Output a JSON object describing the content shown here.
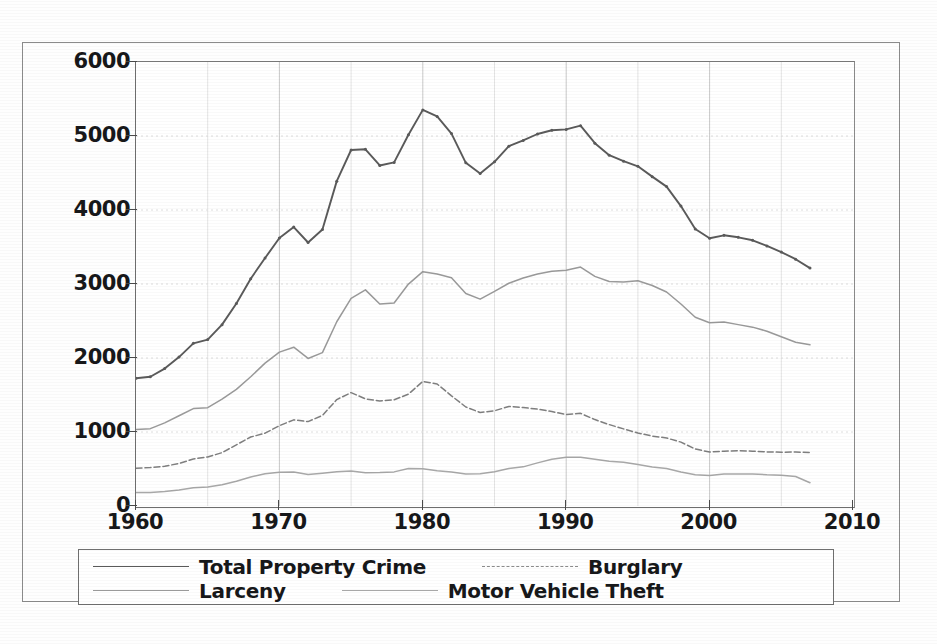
{
  "chart_data": {
    "type": "line",
    "title": "",
    "xlabel": "",
    "ylabel": "",
    "xlim": [
      1960,
      2010
    ],
    "ylim": [
      0,
      6000
    ],
    "grid": true,
    "legend_position": "below-plot",
    "x_ticks": [
      "1960",
      "1970",
      "1980",
      "1990",
      "2000",
      "2010"
    ],
    "y_ticks": [
      "0",
      "1000",
      "2000",
      "3000",
      "4000",
      "5000",
      "6000"
    ],
    "x": [
      1960,
      1961,
      1962,
      1963,
      1964,
      1965,
      1966,
      1967,
      1968,
      1969,
      1970,
      1971,
      1972,
      1973,
      1974,
      1975,
      1976,
      1977,
      1978,
      1979,
      1980,
      1981,
      1982,
      1983,
      1984,
      1985,
      1986,
      1987,
      1988,
      1989,
      1990,
      1991,
      1992,
      1993,
      1994,
      1995,
      1996,
      1997,
      1998,
      1999,
      2000,
      2001,
      2002,
      2003,
      2004,
      2005,
      2006,
      2007
    ],
    "series": [
      {
        "name": "Total Property Crime",
        "color": "#5a5a5a",
        "style": "solid",
        "values": [
          1726,
          1747,
          1857,
          2012,
          2198,
          2249,
          2451,
          2737,
          3072,
          3351,
          3621,
          3769,
          3561,
          3737,
          4390,
          4811,
          4820,
          4602,
          4643,
          5017,
          5353,
          5264,
          5033,
          4637,
          4492,
          4651,
          4863,
          4940,
          5027,
          5078,
          5089,
          5140,
          4903,
          4740,
          4660,
          4591,
          4451,
          4316,
          4053,
          3744,
          3618,
          3658,
          3631,
          3591,
          3514,
          3432,
          3335,
          3215
        ]
      },
      {
        "name": "Burglary",
        "color": "#7f7f7f",
        "style": "dashed",
        "values": [
          509,
          519,
          536,
          576,
          635,
          663,
          721,
          827,
          932,
          984,
          1085,
          1164,
          1141,
          1223,
          1438,
          1532,
          1448,
          1420,
          1435,
          1512,
          1684,
          1649,
          1489,
          1338,
          1264,
          1287,
          1345,
          1330,
          1309,
          1276,
          1236,
          1252,
          1168,
          1100,
          1042,
          987,
          945,
          919,
          863,
          770,
          729,
          741,
          747,
          741,
          730,
          727,
          729,
          722
        ]
      },
      {
        "name": "Larceny",
        "color": "#9a9a9a",
        "style": "solid",
        "values": [
          1035,
          1045,
          1124,
          1219,
          1316,
          1329,
          1443,
          1576,
          1747,
          1931,
          2079,
          2146,
          1994,
          2072,
          2490,
          2805,
          2921,
          2730,
          2744,
          2999,
          3167,
          3135,
          3084,
          2871,
          2795,
          2901,
          3010,
          3081,
          3135,
          3171,
          3185,
          3229,
          3103,
          3034,
          3026,
          3043,
          2980,
          2892,
          2729,
          2551,
          2477,
          2486,
          2451,
          2417,
          2362,
          2287,
          2213,
          2178
        ]
      },
      {
        "name": "Motor Vehicle Theft",
        "color": "#a8a8a8",
        "style": "solid",
        "values": [
          183,
          184,
          197,
          217,
          247,
          257,
          287,
          334,
          393,
          436,
          457,
          460,
          426,
          443,
          462,
          474,
          450,
          452,
          461,
          506,
          502,
          475,
          459,
          431,
          437,
          463,
          508,
          529,
          583,
          631,
          658,
          659,
          632,
          606,
          592,
          561,
          526,
          506,
          460,
          422,
          412,
          431,
          433,
          433,
          422,
          417,
          398,
          315
        ]
      }
    ]
  },
  "legend": {
    "entries": [
      {
        "label": "Total Property Crime"
      },
      {
        "label": "Burglary"
      },
      {
        "label": "Larceny"
      },
      {
        "label": "Motor Vehicle Theft"
      }
    ]
  },
  "colors": {
    "total_property_crime": "#5a5a5a",
    "burglary": "#7f7f7f",
    "larceny": "#9a9a9a",
    "motor_vehicle_theft": "#a8a8a8",
    "axis": "#4a4a4a",
    "grid": "#c9c9c9",
    "frame": "#6f6f6f",
    "text": "#17181a"
  }
}
